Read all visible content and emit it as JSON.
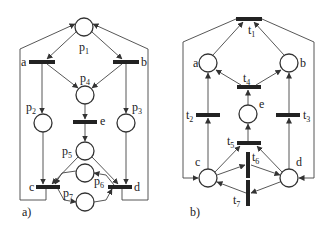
{
  "figure": {
    "colors": {
      "stroke": "#333333",
      "background": "#ffffff",
      "text": "#222222"
    },
    "panel_a": {
      "caption": "a)",
      "places": [
        {
          "id": "p1",
          "name": "p",
          "sub": "1"
        },
        {
          "id": "p2",
          "name": "p",
          "sub": "2"
        },
        {
          "id": "p3",
          "name": "p",
          "sub": "3"
        },
        {
          "id": "p4",
          "name": "p",
          "sub": "4"
        },
        {
          "id": "p5",
          "name": "p",
          "sub": "5"
        },
        {
          "id": "p6",
          "name": "p",
          "sub": "6"
        },
        {
          "id": "p7",
          "name": "p",
          "sub": "7"
        }
      ],
      "transitions": [
        "a",
        "b",
        "c",
        "d",
        "e"
      ]
    },
    "panel_b": {
      "caption": "b)",
      "places": [
        "a",
        "b",
        "c",
        "d",
        "e"
      ],
      "transitions": [
        {
          "id": "t1",
          "name": "t",
          "sub": "1"
        },
        {
          "id": "t2",
          "name": "t",
          "sub": "2"
        },
        {
          "id": "t3",
          "name": "t",
          "sub": "3"
        },
        {
          "id": "t4",
          "name": "t",
          "sub": "4"
        },
        {
          "id": "t5",
          "name": "t",
          "sub": "5"
        },
        {
          "id": "t6",
          "name": "t",
          "sub": "6"
        },
        {
          "id": "t7",
          "name": "t",
          "sub": "7"
        }
      ]
    }
  }
}
